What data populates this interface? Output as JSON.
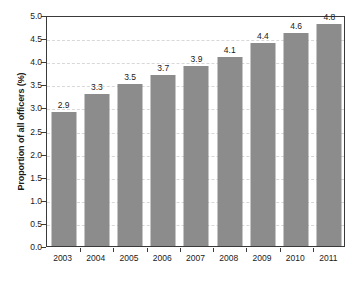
{
  "chart_data": {
    "type": "bar",
    "title": "",
    "subtitle": "",
    "xlabel": "",
    "ylabel": "Proportion of all officers (%)",
    "categories": [
      "2003",
      "2004",
      "2005",
      "2006",
      "2007",
      "2008",
      "2009",
      "2010",
      "2011"
    ],
    "values": [
      2.9,
      3.3,
      3.5,
      3.7,
      3.9,
      4.1,
      4.4,
      4.6,
      4.8
    ],
    "value_labels": [
      "2.9",
      "3.3",
      "3.5",
      "3.7",
      "3.9",
      "4.1",
      "4.4",
      "4.6",
      "4.8"
    ],
    "ylim": [
      0.0,
      5.0
    ],
    "ytick_values": [
      0.0,
      0.5,
      1.0,
      1.5,
      2.0,
      2.5,
      3.0,
      3.5,
      4.0,
      4.5,
      5.0
    ],
    "ytick_labels": [
      "0.0",
      "0.5",
      "1.0",
      "1.5",
      "2.0",
      "2.5",
      "3.0",
      "3.5",
      "4.0",
      "4.5",
      "5.0"
    ],
    "grid": true,
    "grid_axis": "y",
    "grid_style": "dashed",
    "legend": false,
    "legend_position": "none",
    "bar_color": "#8c8c8c",
    "grid_color": "#d8d8d8",
    "axis_color": "#3a3a3a",
    "text_color": "#1a1a1a",
    "background_color": "#ffffff"
  }
}
